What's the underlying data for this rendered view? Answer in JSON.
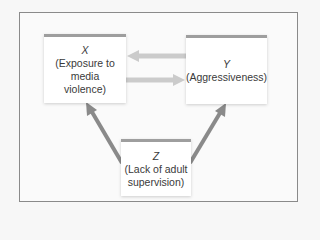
{
  "diagram": {
    "type": "causal-triangle",
    "nodes": {
      "x": {
        "var": "X",
        "label_lines": [
          "(Exposure to",
          "media",
          "violence)"
        ]
      },
      "y": {
        "var": "Y",
        "label_lines": [
          "(Aggressiveness)"
        ]
      },
      "z": {
        "var": "Z",
        "label_lines": [
          "(Lack of adult",
          "supervision)"
        ]
      }
    },
    "edges": [
      {
        "from": "Y",
        "to": "X"
      },
      {
        "from": "X",
        "to": "Y"
      },
      {
        "from": "Z",
        "to": "X"
      },
      {
        "from": "Z",
        "to": "Y"
      }
    ],
    "colors": {
      "horizontal_arrow": "#c8c8c8",
      "diagonal_arrow": "#8a8a8a",
      "box_top_border": "#9e9e9e",
      "frame_border": "#8a8a8a"
    }
  }
}
